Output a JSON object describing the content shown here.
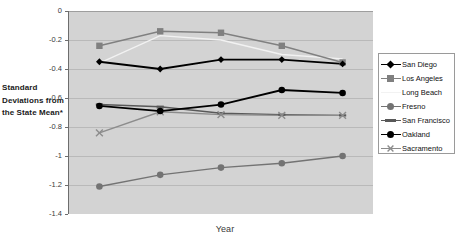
{
  "chart_data": {
    "type": "line",
    "title": "",
    "xlabel": "Year",
    "ylabel": "Standard Deviations from the State Mean*",
    "categories": [
      "2002",
      "2003",
      "2004",
      "2005",
      "2006"
    ],
    "x": [
      2002,
      2003,
      2004,
      2005,
      2006
    ],
    "ylim": [
      -1.4,
      0
    ],
    "xlim": [
      2001.6,
      2006.4
    ],
    "yticks": [
      "0",
      "-0.2",
      "-0.4",
      "-0.6",
      "-0.8",
      "-1",
      "-1.2",
      "-1.4"
    ],
    "ytick_values": [
      0,
      -0.2,
      -0.4,
      -0.6,
      -0.8,
      -1,
      -1.2,
      -1.4
    ],
    "grid": true,
    "grid_axis": "y",
    "legend_position": "right",
    "xaxis_labels_position": "top",
    "plot_background": "#d3d3d3",
    "series": [
      {
        "name": "San Diego",
        "color": "#000000",
        "marker": "diamond",
        "values": [
          -0.35,
          -0.4,
          -0.335,
          -0.335,
          -0.365
        ]
      },
      {
        "name": "Los Angeles",
        "color": "#808080",
        "marker": "square",
        "values": [
          -0.24,
          -0.14,
          -0.15,
          -0.24,
          -0.355
        ]
      },
      {
        "name": "Long Beach",
        "color": "#f2f2f2",
        "marker": "none",
        "values": [
          -0.36,
          -0.17,
          -0.2,
          -0.3,
          -0.33
        ]
      },
      {
        "name": "Fresno",
        "color": "#737373",
        "marker": "circle",
        "values": [
          -1.21,
          -1.13,
          -1.08,
          -1.05,
          -1.0
        ]
      },
      {
        "name": "San Francisco",
        "color": "#595959",
        "marker": "dash",
        "values": [
          -0.645,
          -0.66,
          -0.705,
          -0.715,
          -0.72
        ]
      },
      {
        "name": "Oakland",
        "color": "#000000",
        "marker": "circle",
        "values": [
          -0.655,
          -0.69,
          -0.645,
          -0.545,
          -0.565
        ]
      },
      {
        "name": "Sacramento",
        "color": "#8c8c8c",
        "marker": "cross",
        "values": [
          -0.84,
          -0.695,
          -0.715,
          -0.72,
          -0.72
        ]
      }
    ]
  },
  "axes": {
    "y_title": "Standard Deviations from the State Mean*",
    "x_title": "Year",
    "y_ticks": [
      "0",
      "-0.2",
      "-0.4",
      "-0.6",
      "-0.8",
      "-1",
      "-1.2",
      "-1.4"
    ],
    "x_ticks": [
      "2002",
      "2003",
      "2004",
      "2005",
      "2006"
    ]
  },
  "legend": {
    "items": [
      {
        "label": "San Diego"
      },
      {
        "label": "Los Angeles"
      },
      {
        "label": "Long Beach"
      },
      {
        "label": "Fresno"
      },
      {
        "label": "San Francisco"
      },
      {
        "label": "Oakland"
      },
      {
        "label": "Sacramento"
      }
    ]
  }
}
